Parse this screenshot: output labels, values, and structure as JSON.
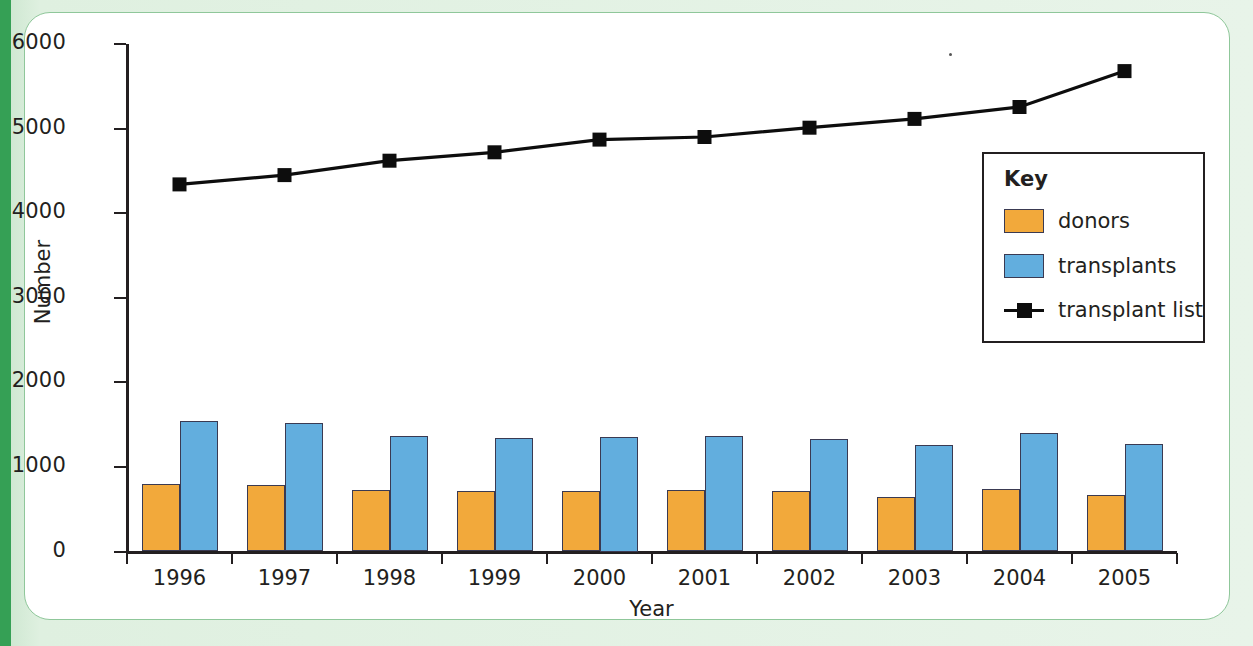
{
  "chart_data": {
    "type": "bar",
    "title": "",
    "xlabel": "Year",
    "ylabel": "Number",
    "categories": [
      "1996",
      "1997",
      "1998",
      "1999",
      "2000",
      "2001",
      "2002",
      "2003",
      "2004",
      "2005"
    ],
    "ylim": [
      0,
      6000
    ],
    "y_ticks": [
      0,
      1000,
      2000,
      3000,
      4000,
      5000,
      6000
    ],
    "y_tick_labels": [
      "0",
      "1000",
      "2000",
      "3000",
      "4000",
      "5000",
      "6000"
    ],
    "grid": false,
    "legend_position": "inside-right",
    "legend_title": "Key",
    "series": [
      {
        "name": "donors",
        "type": "bar",
        "color": "#f2a93b",
        "values": [
          800,
          790,
          730,
          710,
          720,
          725,
          710,
          650,
          735,
          670
        ]
      },
      {
        "name": "transplants",
        "type": "bar",
        "color": "#62aede",
        "values": [
          1545,
          1525,
          1365,
          1345,
          1350,
          1370,
          1325,
          1265,
          1405,
          1270
        ]
      },
      {
        "name": "transplant list",
        "type": "line",
        "color": "#0d0d0d",
        "marker": "square",
        "values": [
          4340,
          4450,
          4620,
          4720,
          4870,
          4900,
          5010,
          5115,
          5255,
          5680
        ]
      }
    ]
  },
  "axes": {
    "y_title": "Number",
    "x_title": "Year"
  },
  "legend": {
    "title": "Key",
    "items": [
      {
        "label": "donors",
        "swatch": "donors-swatch-icon"
      },
      {
        "label": "transplants",
        "swatch": "transplants-swatch-icon"
      },
      {
        "label": "transplant list",
        "swatch": "transplant-list-line-icon"
      }
    ]
  },
  "colors": {
    "donors": "#f2a93b",
    "transplants": "#62aede",
    "transplant_list": "#0d0d0d",
    "panel_background": "#ffffff",
    "page_background": "#e8f4e9",
    "page_accent_stripe": "#35a055",
    "axis": "#231f20"
  }
}
